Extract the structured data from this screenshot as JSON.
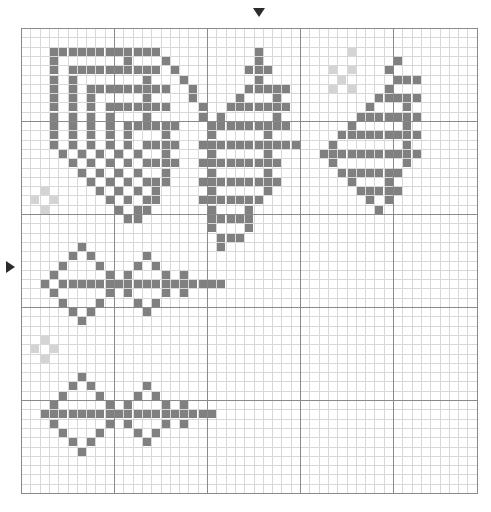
{
  "document": {
    "title": "Cross-stitch pattern chart",
    "type": "pixel-grid-chart"
  },
  "grid": {
    "columns": 49,
    "rows": 50,
    "cell_size": 9.3,
    "origin_x": 21,
    "origin_y": 28,
    "minor_line_color": "#d8d8d8",
    "major_line_color": "#8a8a8a",
    "major_every": 10,
    "background_color": "#ffffff",
    "outer_border_color": "#8a8a8a"
  },
  "palette": {
    "dark": "#808080",
    "light": "#d4d4d4",
    "empty": "#ffffff"
  },
  "markers": {
    "top": {
      "name": "center-column-marker",
      "glyph": "▼",
      "column": 25,
      "color": "#2b2b2b"
    },
    "left": {
      "name": "center-row-marker",
      "glyph": "▶",
      "row": 26,
      "color": "#2b2b2b"
    }
  },
  "chart_data": {
    "type": "heatmap",
    "xlabel": "",
    "ylabel": "",
    "legend": [
      {
        "key": "D",
        "label": "dark stitch",
        "color": "#808080"
      },
      {
        "key": "L",
        "label": "light stitch",
        "color": "#d4d4d4"
      },
      {
        "key": ".",
        "label": "empty",
        "color": "#ffffff"
      }
    ],
    "columns": 49,
    "rows": 50,
    "grid_on": true,
    "cells": [
      ".................................................",
      ".................................................",
      "...DDDDDDDDDDDD..........D.........L.............",
      "...D.......D...D.........D..............D........",
      "...D.DDDDDDDDDD.D.......DDD......L.L...D.........",
      "...D.D.......D...D.......D........L.....DDD......",
      "...D.D.DDDDDDDDD..D.....DDDDD....L.L...D.........",
      "...D.D.D.....D....D....D...D..........DDDDD......",
      "...D.D.D.DDDDDDD...D..DDDDDDD........D...D.......",
      "...D.D.D.D...D.....D.D.....D........DDDDDDD......",
      "...D.D.D.D.DDDDDD...DDDDDDDDD......D.....D.......",
      "...D.D.D.D.D...D....D.....D.......DDDDDDDDD......",
      "...D.D.D.D.D.DDDD..DDDDDDDDDDD...D.......D.......",
      "....D.D.D.D.D..D....D.....D.....DDDDDDDDDDD......",
      ".....D.D.D.D.DDDD..DDDDDDDDD.....D.......D.......",
      "......D.D.D.D..D....D.....D.......DDDDDDD........",
      ".......D.D.D.DDD...DDDDDDDDD.......D...D.........",
      "..L.....D.D.D.D.....D.....D.........DDDDD........",
      ".L.L.....D.D.DD....DDDDDDD...........D.D.........",
      "..L.......D.DD......D...D.............D..........",
      "...........DD.......DDDDD........................",
      "....................D...D........................",
      ".....................DDD.........................",
      "......D..............D...........................",
      ".....D.D.....D...................................",
      "....D...D...D.D..................................",
      "...D.....D.D...D.D...............................",
      "..D.DDDDDDDDDDDDDDDDDD...........................",
      "...D.....D.D...D.D...............................",
      "....D...D...D.D..................................",
      ".....D.D.....D...................................",
      "......D..........................................",
      ".................................................",
      "..L..............................................",
      ".L.L.............................................",
      "..L..............................................",
      ".................................................",
      "......D..........................................",
      ".....D.D.....D...................................",
      "....D...D...D.D..................................",
      "...D.....D.D...D.D...............................",
      "..DDDDDDDDDDDDDDDDDDD............................",
      "...D.....D.D...D.D...............................",
      "....D...D...D.D..................................",
      ".....D.D.....D...................................",
      "......D..........................................",
      ".................................................",
      ".................................................",
      ".................................................",
      "................................................."
    ]
  }
}
